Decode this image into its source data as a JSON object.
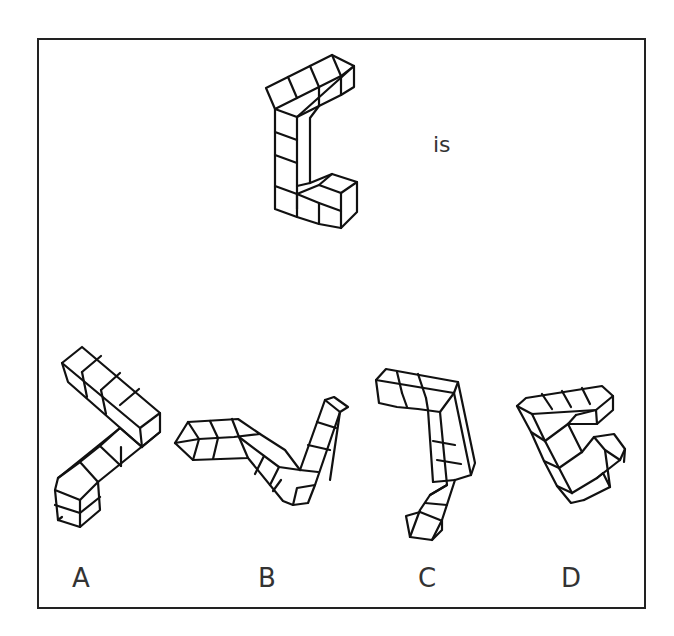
{
  "question": {
    "connector_text": "is",
    "reference_shape": {
      "description": "L/C-shaped polycube: vertical column of 4 cubes, top arm of 4 cubes receding back-right, bottom arm of 3 cubes to the right",
      "lines": [
        "275,109 297,98 319,87 341,76 354,66 332,55 310,66 288,77 266,88 275,109",
        "275,109 297,117 354,66",
        "297,98 288,77",
        "319,87 310,66",
        "341,76 332,55",
        "297,117 319,106 341,95 354,87 354,66",
        "319,106 319,87",
        "341,95 341,76",
        "297,117 297,140 297,163 297,186 297,209",
        "275,109 275,186",
        "275,132 297,140",
        "275,155 297,163",
        "319,106 310,118 310,183",
        "275,186 297,194 319,203 341,211 341,228",
        "297,194 297,217",
        "319,203 319,224",
        "310,183 332,174 357,182 341,193 319,185 297,194",
        "332,174 319,185",
        "341,193 341,211",
        "357,182 357,212 341,228",
        "275,186 275,209 297,217 319,224 341,228",
        "297,186 310,183"
      ]
    },
    "options": [
      {
        "label": "A",
        "lines": [
          "62,363 82,347 160,413 140,428 62,363",
          "62,363 68,382 142,447 140,428",
          "82,372 101,356",
          "101,390 120,373",
          "120,405 139,389",
          "82,372 87,397",
          "101,390 106,414",
          "160,413 160,432 142,447",
          "142,447 120,428 58,478 55,490 80,500 98,482 160,432",
          "120,428 100,446 121,466",
          "100,446 80,462 98,482",
          "80,462 58,478",
          "121,466 121,447",
          "55,490 58,520 80,527 100,510 98,482",
          "55,505 80,513 100,497",
          "80,500 80,527",
          "58,520 62,517"
        ]
      },
      {
        "label": "B",
        "lines": [
          "175,443 188,422 238,419 260,434 234,437 199,439 175,443",
          "188,422 199,439",
          "210,421 218,438",
          "232,419 239,437",
          "175,443 193,460 248,458 239,437",
          "199,439 193,460",
          "218,438 213,459",
          "248,458 283,501 293,505 308,503 315,485",
          "239,437 279,467 300,470",
          "260,434 285,450 300,470",
          "264,456 255,474",
          "281,480 273,491",
          "279,467 270,485",
          "300,470 325,400 334,397 348,407 340,412 315,485",
          "325,400 340,412",
          "340,412 330,480",
          "317,422 336,428",
          "308,445 330,450",
          "300,470 318,472",
          "293,505 297,488 315,485"
        ]
      },
      {
        "label": "C",
        "lines": [
          "376,380 386,369 458,382 454,393 376,380",
          "376,380 379,403 397,407 418,409 440,412 454,393",
          "397,372 402,393",
          "418,374 426,398",
          "402,393 407,407",
          "426,398 428,410",
          "454,393 471,475 455,480",
          "458,382 475,463 471,475",
          "440,412 447,485 430,495",
          "428,410 433,482",
          "433,441 455,445",
          "437,460 461,464",
          "433,482 455,480",
          "447,485 430,495 420,510 410,537 432,540 442,520 455,480",
          "425,503 447,505",
          "420,512 440,520",
          "410,537 406,516 420,512",
          "432,540 442,530 442,520"
        ]
      },
      {
        "label": "D",
        "lines": [
          "517,406 526,398 602,386 613,396 596,410 532,414 517,406",
          "542,394 552,409",
          "562,391 571,407",
          "582,388 590,404",
          "596,410 597,424 613,410 613,396",
          "576,415 596,410",
          "576,415 568,424 597,424",
          "517,406 531,432 544,461 557,486 571,503 584,500",
          "532,414 545,441 559,468 572,493",
          "531,432 545,441",
          "544,461 559,468",
          "557,486 572,493",
          "545,441 568,424",
          "559,468 582,452",
          "572,493 597,478",
          "584,500 610,487",
          "582,452 594,437 614,434 625,449 620,460 597,478",
          "594,437 605,450 620,460",
          "605,450 610,487",
          "625,449 624,462",
          "597,478 603,473 610,487",
          "568,424 582,452"
        ]
      }
    ],
    "colors": {
      "stroke": "#111111",
      "border": "#222222",
      "text": "#333333",
      "background": "#ffffff"
    }
  }
}
